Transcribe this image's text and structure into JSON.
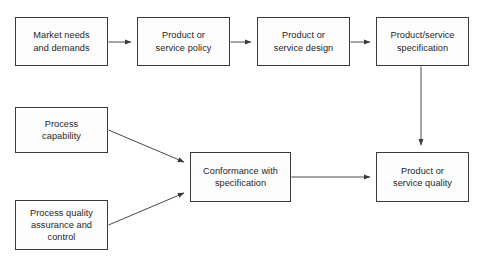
{
  "diagram": {
    "type": "flowchart",
    "canvas": {
      "width": 483,
      "height": 267,
      "background": "#ffffff"
    },
    "style": {
      "node_fill": "#fdfdfd",
      "node_border": "#3a3a3a",
      "text_color": "#262626",
      "edge_color": "#4a4a4a"
    },
    "nodes": [
      {
        "id": "market-needs",
        "label": "Market needs\nand demands",
        "x": 15,
        "y": 17,
        "w": 93,
        "h": 49
      },
      {
        "id": "product-policy",
        "label": "Product or\nservice policy",
        "x": 137,
        "y": 17,
        "w": 93,
        "h": 49
      },
      {
        "id": "product-design",
        "label": "Product or\nservice design",
        "x": 257,
        "y": 17,
        "w": 93,
        "h": 49
      },
      {
        "id": "product-specification",
        "label": "Product/service\nspecification",
        "x": 376,
        "y": 17,
        "w": 93,
        "h": 49
      },
      {
        "id": "process-capability",
        "label": "Process\ncapability",
        "x": 15,
        "y": 107,
        "w": 93,
        "h": 46
      },
      {
        "id": "process-quality-assurance",
        "label": "Process quality\nassurance and\ncontrol",
        "x": 15,
        "y": 200,
        "w": 93,
        "h": 50
      },
      {
        "id": "conformance-with-specification",
        "label": "Conformance with\nspecification",
        "x": 190,
        "y": 152,
        "w": 101,
        "h": 50
      },
      {
        "id": "product-service-quality",
        "label": "Product or\nservice quality",
        "x": 376,
        "y": 152,
        "w": 93,
        "h": 50
      }
    ],
    "edges": [
      {
        "id": "e1",
        "from": "market-needs",
        "to": "product-policy",
        "path": "M 108.5 42 L 131 42",
        "arrow": true
      },
      {
        "id": "e2",
        "from": "product-policy",
        "to": "product-design",
        "path": "M 230.5 42 L 251 42",
        "arrow": true
      },
      {
        "id": "e3",
        "from": "product-design",
        "to": "product-specification",
        "path": "M 350.5 42 L 370 42",
        "arrow": true
      },
      {
        "id": "e4",
        "from": "product-specification",
        "to": "product-service-quality",
        "path": "M 421 66.5 L 421 145",
        "arrow": true
      },
      {
        "id": "e5",
        "from": "process-capability",
        "to": "conformance-with-specification",
        "path": "M 108.5 130 L 184 162",
        "arrow": true
      },
      {
        "id": "e6",
        "from": "process-quality-assurance",
        "to": "conformance-with-specification",
        "path": "M 108.5 225 L 184 193",
        "arrow": true
      },
      {
        "id": "e7",
        "from": "conformance-with-specification",
        "to": "product-service-quality",
        "path": "M 291.5 177 L 370 177",
        "arrow": true
      }
    ]
  }
}
